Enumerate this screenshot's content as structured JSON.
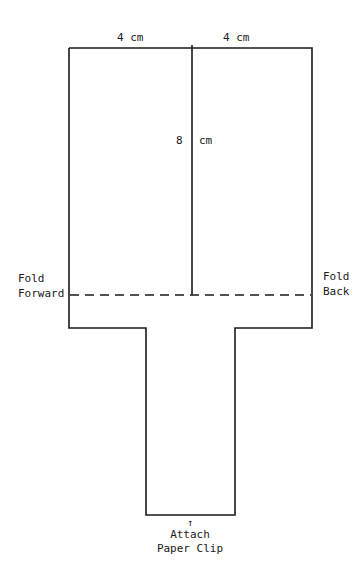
{
  "diagram": {
    "dimensions": {
      "top_left_width": "4 cm",
      "top_right_width": "4 cm",
      "blade_length_number": "8",
      "blade_length_unit": "cm"
    },
    "fold_labels": {
      "left_line1": "Fold",
      "left_line2": "Forward",
      "right_line1": "Fold",
      "right_line2": "Back"
    },
    "bottom_labels": {
      "arrow": "↑",
      "line1": "Attach",
      "line2": "Paper Clip"
    },
    "colors": {
      "line": "#1a1a1a",
      "background": "#ffffff"
    }
  }
}
